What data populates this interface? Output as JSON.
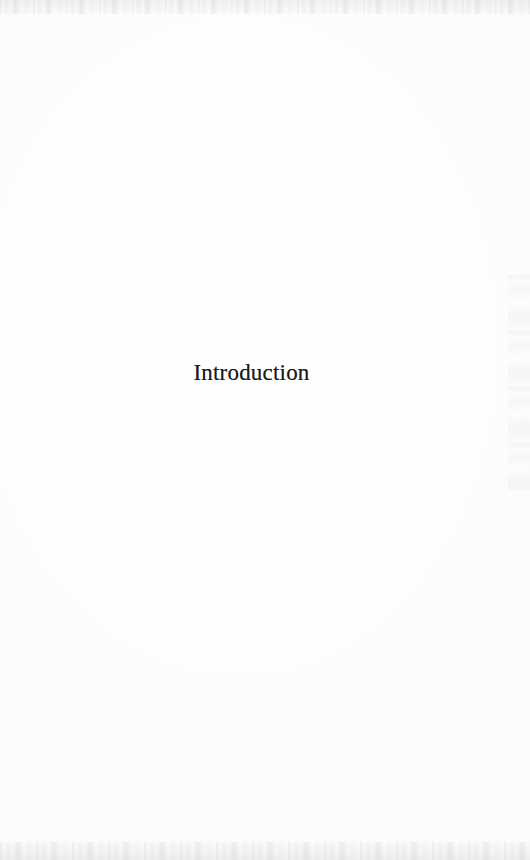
{
  "document": {
    "type": "scanned-book-page",
    "page_kind": "section-divider",
    "background_color": "#fefefe",
    "ink_color": "#1a1a1a"
  },
  "content": {
    "section_title": "Introduction"
  },
  "artifacts": {
    "top_edge_label": "scan-speckle-top",
    "bottom_edge_label": "scan-speckle-bottom",
    "right_edge_label": "scan-smudge-right"
  }
}
